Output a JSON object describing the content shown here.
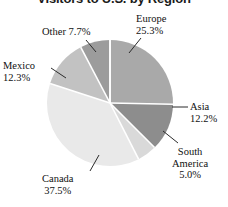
{
  "chart_data": {
    "type": "pie",
    "title": "Visitors to U.S. by Region",
    "categories": [
      "Europe",
      "Asia",
      "South America",
      "Canada",
      "Mexico",
      "Other"
    ],
    "values": [
      25.3,
      12.2,
      5.0,
      37.5,
      12.3,
      7.7
    ],
    "value_unit": "%",
    "labels": [
      {
        "name": "Europe",
        "pct": "25.3%"
      },
      {
        "name": "Asia",
        "pct": "12.2%"
      },
      {
        "name": "South America",
        "pct": "5.0%"
      },
      {
        "name": "Canada",
        "pct": "37.5%"
      },
      {
        "name": "Mexico",
        "pct": "12.3%"
      },
      {
        "name": "Other",
        "pct": "7.7%"
      }
    ],
    "slice_colors": [
      "#a9a9a9",
      "#8d8d8d",
      "#d9d9d9",
      "#e9e9e9",
      "#c2c2c2",
      "#9c9c9c"
    ],
    "separator_color": "#ffffff",
    "legend": "none",
    "start_angle_deg": 0,
    "direction": "clockwise",
    "xlabel": "",
    "ylabel": ""
  },
  "labels": {
    "europe_name": "Europe",
    "europe_pct": "25.3%",
    "asia_name": "Asia",
    "asia_pct": "12.2%",
    "south_name_line1": "South",
    "south_name_line2": "America",
    "south_pct": "5.0%",
    "canada_name": "Canada",
    "canada_pct": "37.5%",
    "mexico_name": "Mexico",
    "mexico_pct": "12.3%",
    "other_name": "Other ",
    "other_pct": "7.7%"
  }
}
